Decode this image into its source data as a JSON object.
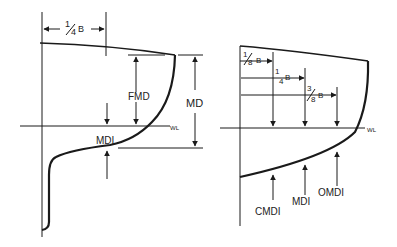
{
  "left_diagram": {
    "quarter_beam": {
      "num": "1",
      "den": "4",
      "unit": "B"
    },
    "fmd_label": "FMD",
    "md_label": "MD",
    "mdi_label": "MDI",
    "waterline_label": "WL"
  },
  "right_diagram": {
    "eighth_beam": {
      "num": "1",
      "den": "8",
      "unit": "B"
    },
    "quarter_beam": {
      "num": "1",
      "den": "4",
      "unit": "B"
    },
    "three_eighth_beam": {
      "num": "3",
      "den": "8",
      "unit": "B"
    },
    "waterline_label": "WL",
    "cmdi_label": "CMDI",
    "mdi_label": "MDI",
    "omdi_label": "OMDI"
  },
  "colors": {
    "line": "#1a1a1a",
    "background": "#ffffff"
  }
}
